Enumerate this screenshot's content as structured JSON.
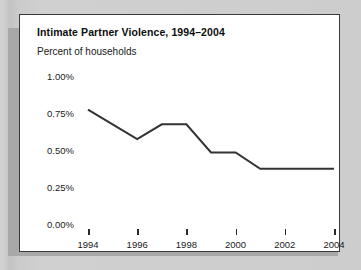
{
  "chart_data": {
    "type": "line",
    "title": "Intimate Partner Violence, 1994–2004",
    "subtitle": "Percent of households",
    "xlabel": "",
    "ylabel": "Percent of households",
    "x": [
      1994,
      1995,
      1996,
      1997,
      1998,
      1999,
      2000,
      2001,
      2002,
      2003,
      2004
    ],
    "series": [
      {
        "name": "Percent of households",
        "values": [
          0.78,
          0.68,
          0.58,
          0.68,
          0.68,
          0.49,
          0.49,
          0.38,
          0.38,
          0.38,
          0.38
        ]
      }
    ],
    "xlim": [
      1994,
      2004
    ],
    "ylim": [
      0.0,
      1.0
    ],
    "y_tick_labels": [
      "1.00%",
      "0.75%",
      "0.50%",
      "0.25%",
      "0.00%"
    ],
    "y_tick_values": [
      1.0,
      0.75,
      0.5,
      0.25,
      0.0
    ],
    "x_tick_labels": [
      "1994",
      "1996",
      "1998",
      "2000",
      "2002",
      "2004"
    ],
    "x_tick_values": [
      1994,
      1996,
      1998,
      2000,
      2002,
      2004
    ],
    "grid": false,
    "legend": false,
    "legend_position": "none",
    "line_color": "#333333",
    "panel_background": "#ffffff",
    "page_background": "#c9c9c9",
    "border_color": "#3a3a3a"
  }
}
